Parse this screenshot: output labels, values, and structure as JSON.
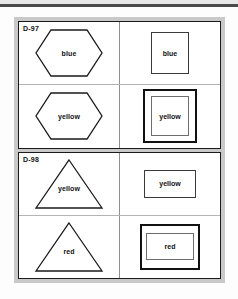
{
  "figure": {
    "top_rule": "horizontal-rule",
    "sections": [
      {
        "label": "D-97",
        "rows": [
          {
            "left": {
              "shape": "hexagon",
              "label": "blue"
            },
            "right": {
              "shape": "square",
              "style": "single",
              "label": "blue"
            }
          },
          {
            "left": {
              "shape": "hexagon",
              "label": "yellow"
            },
            "right": {
              "shape": "square",
              "style": "double",
              "label": "yellow"
            }
          }
        ]
      },
      {
        "label": "D-98",
        "rows": [
          {
            "left": {
              "shape": "triangle",
              "label": "yellow"
            },
            "right": {
              "shape": "rectangle",
              "style": "single",
              "label": "yellow"
            }
          },
          {
            "left": {
              "shape": "triangle",
              "label": "red"
            },
            "right": {
              "shape": "rectangle",
              "style": "double",
              "label": "red"
            }
          }
        ]
      }
    ]
  },
  "colors": {
    "frame": "#c9c9c9",
    "section_border": "#1a1a1a",
    "grid_line": "#8e8e8e",
    "text": "#111111",
    "paper": "#fdfdfd"
  }
}
